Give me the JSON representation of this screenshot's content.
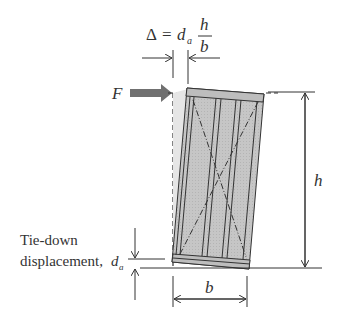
{
  "diagram": {
    "formula": {
      "lhs": "Δ",
      "eq": "=",
      "var": "d",
      "sub": "a",
      "numerator": "h",
      "denominator": "b"
    },
    "force_label": "F",
    "height_label": "h",
    "width_label": "b",
    "tie_down_label_line1": "Tie-down",
    "tie_down_label_line2": "displacement,",
    "tie_down_var": "d",
    "tie_down_sub": "a",
    "colors": {
      "panel_fill": "#c8c8c8",
      "arrow_fill": "#707070",
      "line": "#333333"
    }
  }
}
